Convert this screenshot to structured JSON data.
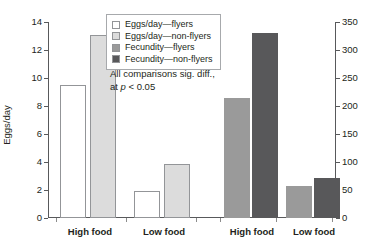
{
  "chart_data": {
    "type": "bar",
    "title": "",
    "subtitle": "",
    "categories": [
      "High food",
      "Low food",
      "High food",
      "Low food"
    ],
    "groups": [
      {
        "name": "Eggs/day",
        "axis": "left",
        "categories": [
          "High food",
          "Low food"
        ],
        "series": [
          {
            "name": "Eggs/day—flyers",
            "values": [
              9.5,
              1.9
            ],
            "color": "#ffffff"
          },
          {
            "name": "Eggs/day—non-flyers",
            "values": [
              13.05,
              3.85
            ],
            "color": "#dcdcdc"
          }
        ]
      },
      {
        "name": "Fecundity",
        "axis": "right",
        "categories": [
          "High food",
          "Low food"
        ],
        "series": [
          {
            "name": "Fecundity—flyers",
            "values": [
              215,
              58
            ],
            "color": "#9a9a9a"
          },
          {
            "name": "Fecundity—non-flyers",
            "values": [
              330,
              72
            ],
            "color": "#58585a"
          }
        ]
      }
    ],
    "bars": [
      {
        "label": "Eggs/day—flyers",
        "category": "High food",
        "value": 9.5,
        "axis": "left",
        "color": "#ffffff"
      },
      {
        "label": "Eggs/day—non-flyers",
        "category": "High food",
        "value": 13.05,
        "axis": "left",
        "color": "#dcdcdc"
      },
      {
        "label": "Eggs/day—flyers",
        "category": "Low food",
        "value": 1.9,
        "axis": "left",
        "color": "#ffffff"
      },
      {
        "label": "Eggs/day—non-flyers",
        "category": "Low food",
        "value": 3.85,
        "axis": "left",
        "color": "#dcdcdc"
      },
      {
        "label": "Fecundity—flyers",
        "category": "High food",
        "value": 215,
        "axis": "right",
        "color": "#9a9a9a"
      },
      {
        "label": "Fecundity—non-flyers",
        "category": "High food",
        "value": 330,
        "axis": "right",
        "color": "#58585a"
      },
      {
        "label": "Fecundity—flyers",
        "category": "Low food",
        "value": 58,
        "axis": "right",
        "color": "#9a9a9a"
      },
      {
        "label": "Fecundity—non-flyers",
        "category": "Low food",
        "value": 72,
        "axis": "right",
        "color": "#58585a"
      }
    ],
    "xlabel": "",
    "ylabel": "Eggs/day",
    "ylabel_right": "Number of eggs",
    "ylim": [
      0,
      14
    ],
    "ylim_right": [
      0,
      350
    ],
    "yticks": [
      0,
      2,
      4,
      6,
      8,
      10,
      12,
      14
    ],
    "yticks_right": [
      0,
      50,
      100,
      150,
      200,
      250,
      300,
      350
    ],
    "grid": false,
    "legend_position": "upper center",
    "legend": [
      {
        "label": "Eggs/day—flyers",
        "color": "#ffffff"
      },
      {
        "label": "Eggs/day—non-flyers",
        "color": "#dcdcdc"
      },
      {
        "label": "Fecundity—flyers",
        "color": "#9a9a9a"
      },
      {
        "label": "Fecundity—non-flyers",
        "color": "#58585a"
      }
    ],
    "annotations": [
      {
        "line1": "All comparisons sig. diff.,",
        "line2_prefix": "at ",
        "line2_italic": "p",
        "line2_suffix": " < 0.05"
      }
    ]
  },
  "axes": {
    "left": {
      "title": "Eggs/day",
      "ticks": [
        "0",
        "2",
        "4",
        "6",
        "8",
        "10",
        "12",
        "14"
      ]
    },
    "right": {
      "title": "Number of eggs",
      "ticks": [
        "0",
        "50",
        "100",
        "150",
        "200",
        "250",
        "300",
        "350"
      ]
    },
    "x": {
      "labels": [
        "High food",
        "Low food",
        "High food",
        "Low food"
      ]
    }
  },
  "annotation": {
    "line1": "All comparisons sig. diff.,",
    "line2_prefix": "at ",
    "line2_italic": "p",
    "line2_suffix": " < 0.05"
  }
}
